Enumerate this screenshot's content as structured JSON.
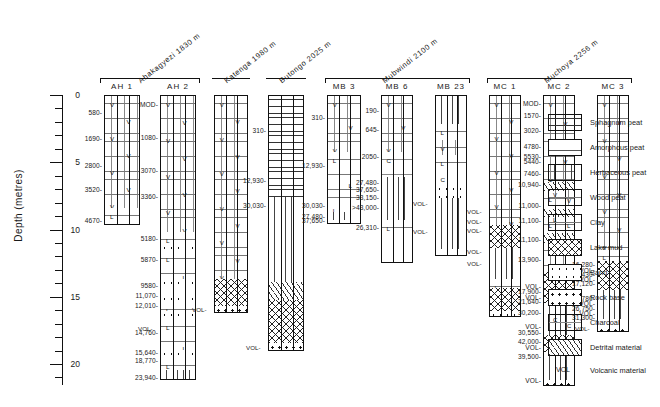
{
  "axis": {
    "title": "Depth (metres)",
    "ticks": [
      {
        "label": "0",
        "value": 0,
        "major": true
      },
      {
        "label": "",
        "value": 1,
        "major": false
      },
      {
        "label": "",
        "value": 2,
        "major": false
      },
      {
        "label": "",
        "value": 3,
        "major": false
      },
      {
        "label": "",
        "value": 4,
        "major": false
      },
      {
        "label": "5",
        "value": 5,
        "major": true
      },
      {
        "label": "",
        "value": 6,
        "major": false
      },
      {
        "label": "",
        "value": 7,
        "major": false
      },
      {
        "label": "",
        "value": 8,
        "major": false
      },
      {
        "label": "",
        "value": 9,
        "major": false
      },
      {
        "label": "10",
        "value": 10,
        "major": true
      },
      {
        "label": "",
        "value": 11,
        "major": false
      },
      {
        "label": "",
        "value": 12,
        "major": false
      },
      {
        "label": "",
        "value": 13,
        "major": false
      },
      {
        "label": "",
        "value": 14,
        "major": false
      },
      {
        "label": "15",
        "value": 15,
        "major": true
      },
      {
        "label": "",
        "value": 16,
        "major": false
      },
      {
        "label": "",
        "value": 17,
        "major": false
      },
      {
        "label": "",
        "value": 18,
        "major": false
      },
      {
        "label": "",
        "value": 19,
        "major": false
      },
      {
        "label": "20",
        "value": 20,
        "major": true
      },
      {
        "label": "",
        "value": 21,
        "major": false
      }
    ]
  },
  "sites": [
    {
      "name": "Ahakagyezi  1830 m",
      "cols": [
        "AH 1",
        "AH 2"
      ]
    },
    {
      "name": "Katenga  1980 m",
      "cols": [
        ""
      ]
    },
    {
      "name": "Butongo  2025 m",
      "cols": [
        ""
      ]
    },
    {
      "name": "Mubwindi  2100 m",
      "cols": [
        "MB 3",
        "MB 6",
        "MB 23"
      ]
    },
    {
      "name": "Muchoya  2256 m",
      "cols": [
        "MC 1",
        "MC 2",
        "MC 3"
      ]
    }
  ],
  "columns": [
    {
      "id": "AH 1",
      "top": 0.0,
      "bottom": 9.7,
      "dates": [
        {
          "label": "580",
          "depth": 1.3
        },
        {
          "label": "1690",
          "depth": 3.2
        },
        {
          "label": "2800",
          "depth": 5.2
        },
        {
          "label": "3520",
          "depth": 7.0
        },
        {
          "label": "4670",
          "depth": 9.3
        }
      ],
      "units": [
        {
          "lith": "woodpeat",
          "from": 0.0,
          "to": 8.3
        },
        {
          "lith": "clay",
          "from": 8.3,
          "to": 9.7
        }
      ]
    },
    {
      "id": "AH 2",
      "top": 0.0,
      "bottom": 21.2,
      "dates": [
        {
          "label": "MOD",
          "depth": 0.7
        },
        {
          "label": "1080",
          "depth": 3.1
        },
        {
          "label": "3070",
          "depth": 5.6
        },
        {
          "label": "3360",
          "depth": 7.5
        },
        {
          "label": "5180",
          "depth": 10.6
        },
        {
          "label": "5870",
          "depth": 12.2
        },
        {
          "label": "9580",
          "depth": 14.1
        },
        {
          "label": "11,070",
          "depth": 14.9
        },
        {
          "label": "12,010",
          "depth": 15.6
        },
        {
          "label": "14,760",
          "depth": 17.6
        },
        {
          "label": "15,640",
          "depth": 19.1
        },
        {
          "label": "18,770",
          "depth": 19.7
        },
        {
          "label": "23,940",
          "depth": 21.0
        }
      ],
      "units": [
        {
          "lith": "woodpeat",
          "from": 0.0,
          "to": 10.1
        },
        {
          "lith": "clay",
          "from": 10.1,
          "to": 11.0
        },
        {
          "lith": "sand",
          "from": 11.0,
          "to": 11.5
        },
        {
          "lith": "clay",
          "from": 11.5,
          "to": 13.6
        },
        {
          "lith": "sand",
          "from": 13.6,
          "to": 14.3
        },
        {
          "lith": "clay",
          "from": 14.3,
          "to": 14.8
        },
        {
          "lith": "sand",
          "from": 14.8,
          "to": 15.3
        },
        {
          "lith": "clay",
          "from": 15.3,
          "to": 16.0
        },
        {
          "lith": "sand",
          "from": 16.0,
          "to": 16.6
        },
        {
          "lith": "clay",
          "from": 16.6,
          "to": 18.9
        },
        {
          "lith": "sand",
          "from": 18.9,
          "to": 19.5
        },
        {
          "lith": "clay",
          "from": 19.5,
          "to": 20.4
        },
        {
          "lith": "herbaceous",
          "from": 20.4,
          "to": 21.2
        }
      ],
      "vol_marks": [
        {
          "label": "VOL",
          "depth": 17.3
        }
      ]
    },
    {
      "id": "",
      "top": 0.0,
      "bottom": 16.2,
      "dates": [],
      "units": [
        {
          "lith": "woodpeat",
          "from": 0.0,
          "to": 13.6
        },
        {
          "lith": "lakemud",
          "from": 13.6,
          "to": 15.6
        },
        {
          "lith": "rockbase",
          "from": 15.6,
          "to": 16.2
        }
      ],
      "vol_marks": [
        {
          "label": "VOL",
          "depth": 15.9
        }
      ]
    },
    {
      "id": "",
      "top": 0.0,
      "bottom": 19.0,
      "dates": [
        {
          "label": "310",
          "depth": 2.6
        },
        {
          "label": "12,930",
          "depth": 6.3
        },
        {
          "label": "30,030",
          "depth": 8.2
        }
      ],
      "units": [
        {
          "lith": "sphagnum",
          "from": 0.0,
          "to": 7.5
        },
        {
          "lith": "herbaceous",
          "from": 7.5,
          "to": 13.8
        },
        {
          "lith": "detrital",
          "from": 13.8,
          "to": 15.2
        },
        {
          "lith": "lakemud",
          "from": 15.2,
          "to": 18.4
        },
        {
          "lith": "rockbase",
          "from": 18.4,
          "to": 19.0
        }
      ],
      "vol_marks": [
        {
          "label": "VOL",
          "depth": 18.7
        }
      ]
    },
    {
      "id": "MB 3",
      "top": 0.0,
      "bottom": 9.6,
      "dates": [
        {
          "label": "310",
          "depth": 1.6
        },
        {
          "label": "12,930",
          "depth": 5.2
        },
        {
          "label": "30,030",
          "depth": 8.2
        },
        {
          "label": "27,480",
          "depth": 9.0
        },
        {
          "label": "37,650",
          "depth": 9.3
        }
      ],
      "units": [
        {
          "lith": "woodpeat",
          "from": 0.0,
          "to": 4.2
        },
        {
          "lith": "clay",
          "from": 4.2,
          "to": 8.6
        },
        {
          "lith": "herbaceous",
          "from": 8.6,
          "to": 9.2
        },
        {
          "lith": "charcoal",
          "from": 9.2,
          "to": 9.6
        }
      ]
    },
    {
      "id": "MB 6",
      "top": 0.0,
      "bottom": 12.5,
      "dates": [
        {
          "label": "190",
          "depth": 1.1
        },
        {
          "label": "645",
          "depth": 2.5
        },
        {
          "label": "2050",
          "depth": 4.5
        },
        {
          "label": "27,480",
          "depth": 6.5
        },
        {
          "label": "37,650",
          "depth": 7.0
        },
        {
          "label": "33,150",
          "depth": 7.6
        },
        {
          "label": ">43,000",
          "depth": 8.3
        },
        {
          "label": "26,310",
          "depth": 9.8
        }
      ],
      "units": [
        {
          "lith": "woodpeat",
          "from": 0.0,
          "to": 4.2
        },
        {
          "lith": "charcoal",
          "from": 4.2,
          "to": 6.0
        },
        {
          "lith": "herbaceous",
          "from": 6.0,
          "to": 9.2
        },
        {
          "lith": "clay",
          "from": 9.2,
          "to": 10.4
        }
      ]
    },
    {
      "id": "MB 23",
      "top": 0.0,
      "bottom": 12.0,
      "dates": [],
      "units": [
        {
          "lith": "herbaceous",
          "from": 0.0,
          "to": 2.1
        },
        {
          "lith": "clay",
          "from": 2.1,
          "to": 3.3
        },
        {
          "lith": "woodpeat",
          "from": 3.3,
          "to": 4.4
        },
        {
          "lith": "clay",
          "from": 4.4,
          "to": 5.6
        },
        {
          "lith": "charcoal",
          "from": 5.6,
          "to": 6.6
        },
        {
          "lith": "sand",
          "from": 6.6,
          "to": 7.6
        },
        {
          "lith": "herbaceous",
          "from": 7.6,
          "to": 11.4
        },
        {
          "lith": "charcoal",
          "from": 11.4,
          "to": 12.0
        }
      ],
      "vol_marks": [
        {
          "label": "VOL",
          "depth": 8.0
        },
        {
          "label": "VOL",
          "depth": 10.1
        }
      ]
    },
    {
      "id": "MC 1",
      "top": 0.0,
      "bottom": 16.5,
      "dates": [],
      "units": [
        {
          "lith": "woodpeat",
          "from": 0.0,
          "to": 9.6
        },
        {
          "lith": "lakemud",
          "from": 9.6,
          "to": 11.3
        },
        {
          "lith": "herbaceous",
          "from": 11.3,
          "to": 13.6
        },
        {
          "lith": "clay",
          "from": 13.6,
          "to": 14.3
        },
        {
          "lith": "lakemud",
          "from": 14.3,
          "to": 16.0
        },
        {
          "lith": "sand",
          "from": 16.0,
          "to": 16.5
        }
      ],
      "vol_marks": [
        {
          "label": "VOL",
          "depth": 8.6
        },
        {
          "label": "VOL",
          "depth": 9.4
        },
        {
          "label": "VOL",
          "depth": 10.0
        },
        {
          "label": "VOL",
          "depth": 11.6
        },
        {
          "label": "VOL",
          "depth": 12.5
        }
      ]
    },
    {
      "id": "MC 2",
      "top": 0.0,
      "bottom": 21.6,
      "dates": [
        {
          "label": "MOD",
          "depth": 0.6
        },
        {
          "label": "1570",
          "depth": 1.5
        },
        {
          "label": "3020",
          "depth": 2.6
        },
        {
          "label": "4780",
          "depth": 3.8
        },
        {
          "label": "5530",
          "depth": 4.5
        },
        {
          "label": "5440",
          "depth": 4.9
        },
        {
          "label": "7460",
          "depth": 5.8
        },
        {
          "label": "10,940",
          "depth": 6.6
        },
        {
          "label": "11,000",
          "depth": 8.2
        },
        {
          "label": "11,100",
          "depth": 9.3
        },
        {
          "label": "11,100",
          "depth": 10.7
        },
        {
          "label": "13,900",
          "depth": 12.2
        },
        {
          "label": "VOL",
          "depth": 14.2
        },
        {
          "label": "17,900",
          "depth": 14.6
        },
        {
          "label": "VOL",
          "depth": 15.0
        },
        {
          "label": "21,640",
          "depth": 15.3
        },
        {
          "label": "30,200",
          "depth": 16.1
        },
        {
          "label": "VOL",
          "depth": 17.2
        },
        {
          "label": "30,550",
          "depth": 17.6
        },
        {
          "label": "42,000",
          "depth": 18.3
        },
        {
          "label": "VOL",
          "depth": 18.7
        },
        {
          "label": "39,500",
          "depth": 19.4
        },
        {
          "label": "VOL",
          "depth": 21.2
        }
      ],
      "units": [
        {
          "lith": "woodpeat",
          "from": 0.0,
          "to": 6.4
        },
        {
          "lith": "detrital",
          "from": 6.4,
          "to": 7.1
        },
        {
          "lith": "clay",
          "from": 7.1,
          "to": 8.4
        },
        {
          "lith": "detrital",
          "from": 8.4,
          "to": 9.0
        },
        {
          "lith": "clay",
          "from": 9.0,
          "to": 10.2
        },
        {
          "lith": "detrital",
          "from": 10.2,
          "to": 10.9
        },
        {
          "lith": "woodpeat",
          "from": 10.9,
          "to": 13.1
        },
        {
          "lith": "lakemud",
          "from": 13.1,
          "to": 15.4
        },
        {
          "lith": "herbaceous",
          "from": 15.4,
          "to": 17.8
        },
        {
          "lith": "lakemud",
          "from": 17.8,
          "to": 19.0
        },
        {
          "lith": "herbaceous",
          "from": 19.0,
          "to": 21.1
        },
        {
          "lith": "rockbase",
          "from": 21.1,
          "to": 21.6
        }
      ]
    },
    {
      "id": "MC 3",
      "top": 0.0,
      "bottom": 17.6,
      "dates": [
        {
          "label": "16,280",
          "depth": 12.6
        },
        {
          "label": "VOL",
          "depth": 13.0
        },
        {
          "label": "16,430",
          "depth": 13.3
        },
        {
          "label": "VOL",
          "depth": 13.7
        },
        {
          "label": "17,120",
          "depth": 14.0
        },
        {
          "label": "24,780",
          "depth": 15.1
        },
        {
          "label": "VOL",
          "depth": 15.5
        },
        {
          "label": "26,750",
          "depth": 15.8
        },
        {
          "label": "VOL",
          "depth": 16.2
        },
        {
          "label": "31,300",
          "depth": 16.5
        }
      ],
      "units": [
        {
          "lith": "woodpeat",
          "from": 0.0,
          "to": 11.4
        },
        {
          "lith": "clay",
          "from": 11.4,
          "to": 12.3
        },
        {
          "lith": "lakemud",
          "from": 12.3,
          "to": 14.4
        },
        {
          "lith": "herbaceous",
          "from": 14.4,
          "to": 16.6
        },
        {
          "lith": "clay",
          "from": 16.6,
          "to": 17.1
        },
        {
          "lith": "rockbase",
          "from": 17.1,
          "to": 17.6
        }
      ],
      "vol_marks": [
        {
          "label": "VOL",
          "depth": 17.35
        }
      ]
    }
  ],
  "legend": {
    "items": [
      {
        "key": "sphagnum",
        "label": "Sphagnum peat"
      },
      {
        "key": "amorphous",
        "label": "Amorphous peat"
      },
      {
        "key": "herbaceous",
        "label": "Herbaceous peat"
      },
      {
        "key": "woodpeat",
        "label": "Wood peat"
      },
      {
        "key": "clay",
        "label": "Clay"
      },
      {
        "key": "lakemud",
        "label": "Lake mud"
      },
      {
        "key": "sand",
        "label": "Sand"
      },
      {
        "key": "rockbase",
        "label": "Rock base"
      },
      {
        "key": "charcoal",
        "label": "Charcoal"
      },
      {
        "key": "detrital",
        "label": "Detrital material"
      }
    ],
    "volcanic": {
      "tag": "VOL",
      "label": "Volcanic material"
    }
  },
  "chart_data": {
    "type": "table",
    "ylabel": "Depth (metres)",
    "ylim": [
      0,
      21
    ],
    "grid": false,
    "legend_position": "right",
    "note": "Radiocarbon dates (years BP) plotted against core depth; VOL marks volcanic ash layers."
  }
}
